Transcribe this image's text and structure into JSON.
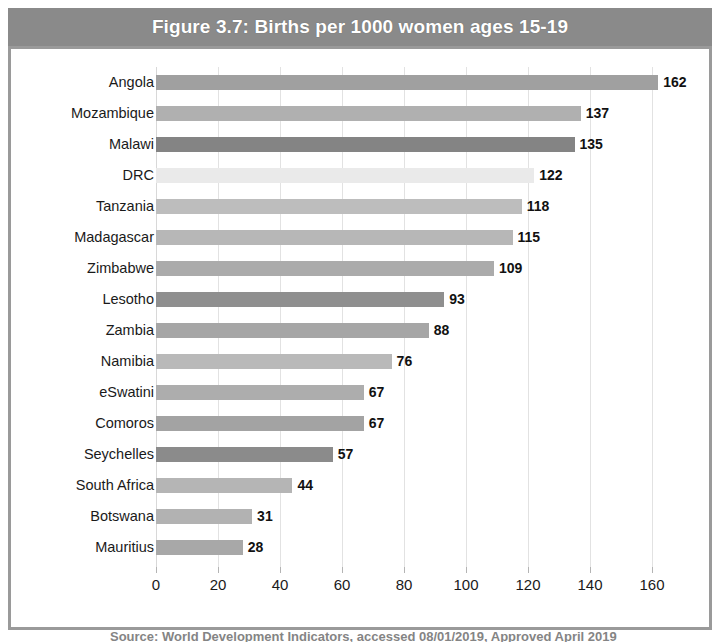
{
  "figure": {
    "title": "Figure 3.7: Births per 1000 women ages 15-19",
    "title_bar_color": "#8a8a8a",
    "frame_color": "#9a9a9a",
    "background": "#ffffff",
    "caption_partial": "Source: World Development Indicators, accessed 08/01/2019, Approved April 2019"
  },
  "chart_data": {
    "type": "bar",
    "orientation": "horizontal",
    "title": "Figure 3.7: Births per 1000 women ages 15-19",
    "xlabel": "",
    "ylabel": "",
    "xlim": [
      0,
      170
    ],
    "xticks": [
      0,
      20,
      40,
      60,
      80,
      100,
      120,
      140,
      160
    ],
    "grid": true,
    "grid_axis": "x",
    "legend": false,
    "value_labels": true,
    "categories": [
      "Angola",
      "Mozambique",
      "Malawi",
      "DRC",
      "Tanzania",
      "Madagascar",
      "Zimbabwe",
      "Lesotho",
      "Zambia",
      "Namibia",
      "eSwatini",
      "Comoros",
      "Seychelles",
      "South Africa",
      "Botswana",
      "Mauritius"
    ],
    "values": [
      162,
      137,
      135,
      122,
      118,
      115,
      109,
      93,
      88,
      76,
      67,
      67,
      57,
      44,
      31,
      28
    ],
    "bars": [
      {
        "category": "Angola",
        "value": 162,
        "label": "162",
        "color": "#a0a0a0"
      },
      {
        "category": "Mozambique",
        "value": 137,
        "label": "137",
        "color": "#b0b0b0"
      },
      {
        "category": "Malawi",
        "value": 135,
        "label": "135",
        "color": "#848484"
      },
      {
        "category": "DRC",
        "value": 122,
        "label": "122",
        "color": "#eaeaea"
      },
      {
        "category": "Tanzania",
        "value": 118,
        "label": "118",
        "color": "#bdbdbd"
      },
      {
        "category": "Madagascar",
        "value": 115,
        "label": "115",
        "color": "#b7b7b7"
      },
      {
        "category": "Zimbabwe",
        "value": 109,
        "label": "109",
        "color": "#ababab"
      },
      {
        "category": "Lesotho",
        "value": 93,
        "label": "93",
        "color": "#8f8f8f"
      },
      {
        "category": "Zambia",
        "value": 88,
        "label": "88",
        "color": "#a6a6a6"
      },
      {
        "category": "Namibia",
        "value": 76,
        "label": "76",
        "color": "#b9b9b9"
      },
      {
        "category": "eSwatini",
        "value": 67,
        "label": "67",
        "color": "#adadad"
      },
      {
        "category": "Comoros",
        "value": 67,
        "label": "67",
        "color": "#a3a3a3"
      },
      {
        "category": "Seychelles",
        "value": 57,
        "label": "57",
        "color": "#8b8b8b"
      },
      {
        "category": "South Africa",
        "value": 44,
        "label": "44",
        "color": "#b5b5b5"
      },
      {
        "category": "Botswana",
        "value": 31,
        "label": "31",
        "color": "#b2b2b2"
      },
      {
        "category": "Mauritius",
        "value": 28,
        "label": "28",
        "color": "#a8a8a8"
      }
    ]
  }
}
